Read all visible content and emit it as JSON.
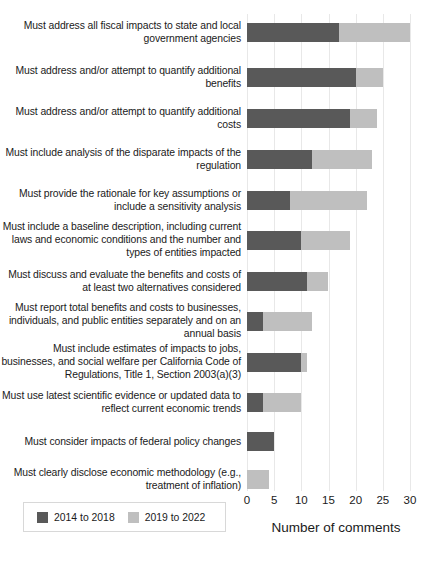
{
  "chart_data": {
    "type": "bar",
    "orientation": "horizontal",
    "stacked": true,
    "title": "",
    "xlabel": "Number of comments",
    "ylabel": "",
    "xlim": [
      0,
      30
    ],
    "xticks": [
      0,
      5,
      10,
      15,
      20,
      25,
      30
    ],
    "grid": true,
    "legend_position": "bottom-left",
    "categories": [
      "Must address all fiscal impacts to state and local government agencies",
      "Must address and/or attempt to quantify additional benefits",
      "Must address and/or attempt to quantify additional costs",
      "Must include analysis of the disparate impacts of the regulation",
      "Must provide the rationale for key assumptions or include a sensitivity analysis",
      "Must include a baseline description, including current laws and economic conditions and the number and types of entities impacted",
      "Must discuss and evaluate the benefits and costs of at least two alternatives considered",
      "Must report total benefits and costs to businesses, individuals, and public entities separately and on an annual basis",
      "Must include estimates of impacts to jobs, businesses, and social welfare per California Code of Regulations, Title 1, Section 2003(a)(3)",
      "Must use latest scientific evidence or updated data to reflect current economic trends",
      "Must consider impacts of federal policy changes",
      "Must clearly disclose economic methodology (e.g., treatment of inflation)"
    ],
    "series": [
      {
        "name": "2014 to 2018",
        "color": "#595959",
        "values": [
          17,
          20,
          19,
          12,
          8,
          10,
          11,
          3,
          10,
          3,
          5,
          0
        ]
      },
      {
        "name": "2019 to 2022",
        "color": "#bfbfbf",
        "values": [
          13,
          5,
          5,
          11,
          14,
          9,
          4,
          9,
          1,
          7,
          0,
          4
        ]
      }
    ],
    "totals": [
      30,
      25,
      24,
      23,
      22,
      19,
      15,
      12,
      11,
      10,
      5,
      4
    ]
  },
  "axis": {
    "tick_labels": [
      "0",
      "5",
      "10",
      "15",
      "20",
      "25",
      "30"
    ],
    "x_title": "Number of comments"
  },
  "legend": {
    "entries": [
      {
        "label": "2014 to 2018",
        "color": "#595959"
      },
      {
        "label": "2019 to 2022",
        "color": "#bfbfbf"
      }
    ]
  }
}
